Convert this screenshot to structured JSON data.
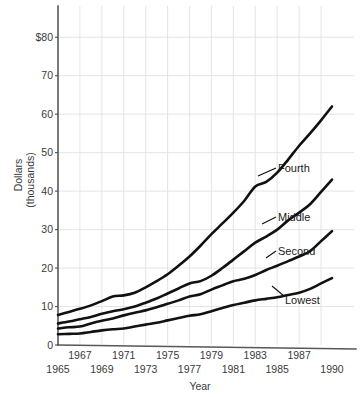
{
  "chart_data": {
    "type": "line",
    "title": "",
    "xlabel": "Year",
    "ylabel": "Dollars (thousands)",
    "ylabel_line1": "Dollars",
    "ylabel_line2": "(thousands)",
    "xlim": [
      1965,
      1990
    ],
    "ylim": [
      0,
      85
    ],
    "grid": true,
    "legend_position": "inline-annotations",
    "y_ticks": [
      {
        "value": 80,
        "label": "$80"
      },
      {
        "value": 70,
        "label": "70"
      },
      {
        "value": 60,
        "label": "60"
      },
      {
        "value": 50,
        "label": "50"
      },
      {
        "value": 40,
        "label": "40"
      },
      {
        "value": 30,
        "label": "30"
      },
      {
        "value": 20,
        "label": "20"
      },
      {
        "value": 10,
        "label": "10"
      },
      {
        "value": 0,
        "label": "0"
      }
    ],
    "x_ticks_upper": [
      {
        "value": 1967,
        "label": "1967"
      },
      {
        "value": 1971,
        "label": "1971"
      },
      {
        "value": 1975,
        "label": "1975"
      },
      {
        "value": 1979,
        "label": "1979"
      },
      {
        "value": 1983,
        "label": "1983"
      },
      {
        "value": 1987,
        "label": "1987"
      }
    ],
    "x_ticks_lower": [
      {
        "value": 1965,
        "label": "1965"
      },
      {
        "value": 1969,
        "label": "1969"
      },
      {
        "value": 1973,
        "label": "1973"
      },
      {
        "value": 1977,
        "label": "1977"
      },
      {
        "value": 1981,
        "label": "1981"
      },
      {
        "value": 1985,
        "label": "1985"
      },
      {
        "value": 1990,
        "label": "1990"
      }
    ],
    "x_gridlines": [
      1967,
      1969,
      1971,
      1973,
      1975,
      1977,
      1979,
      1981,
      1983,
      1985,
      1987,
      1989
    ],
    "x": [
      1965,
      1966,
      1967,
      1968,
      1969,
      1970,
      1971,
      1972,
      1973,
      1974,
      1975,
      1976,
      1977,
      1978,
      1979,
      1980,
      1981,
      1982,
      1983,
      1984,
      1985,
      1986,
      1987,
      1988,
      1989,
      1990
    ],
    "series": [
      {
        "name": "Fourth",
        "label": "Fourth",
        "color": "#111111",
        "values": [
          7.8,
          8.6,
          9.4,
          10.3,
          11.4,
          12.6,
          12.9,
          13.6,
          15.0,
          16.6,
          18.4,
          20.6,
          23.0,
          25.8,
          28.8,
          31.6,
          34.4,
          37.5,
          41.2,
          42.4,
          44.8,
          48.2,
          51.8,
          55.0,
          58.4,
          62.0
        ]
      },
      {
        "name": "Middle",
        "label": "Middle",
        "color": "#111111",
        "values": [
          5.6,
          6.1,
          6.7,
          7.3,
          8.1,
          8.8,
          9.3,
          10.0,
          11.0,
          12.1,
          13.4,
          14.7,
          16.0,
          16.6,
          18.0,
          20.0,
          22.2,
          24.4,
          26.6,
          28.2,
          30.0,
          32.4,
          34.4,
          36.6,
          39.8,
          43.0
        ]
      },
      {
        "name": "Second",
        "label": "Second",
        "color": "#111111",
        "values": [
          4.3,
          4.6,
          4.8,
          5.6,
          6.3,
          6.9,
          7.7,
          8.4,
          9.0,
          9.8,
          10.7,
          11.6,
          12.6,
          13.2,
          14.4,
          15.5,
          16.6,
          17.2,
          18.2,
          19.5,
          20.6,
          21.8,
          23.0,
          24.4,
          27.0,
          29.6
        ]
      },
      {
        "name": "Lowest",
        "label": "Lowest",
        "color": "#111111",
        "values": [
          2.8,
          2.9,
          3.0,
          3.4,
          3.8,
          4.1,
          4.3,
          4.8,
          5.3,
          5.8,
          6.4,
          7.0,
          7.6,
          8.0,
          8.8,
          9.6,
          10.4,
          11.0,
          11.6,
          12.0,
          12.4,
          13.0,
          13.6,
          14.6,
          16.0,
          17.4
        ]
      }
    ],
    "annotations": [
      {
        "label": "Fourth",
        "x": 278,
        "y": 168
      },
      {
        "label": "Middle",
        "x": 278,
        "y": 217
      },
      {
        "label": "Second",
        "x": 278,
        "y": 251
      },
      {
        "label": "Lowest",
        "x": 285,
        "y": 300
      }
    ]
  }
}
